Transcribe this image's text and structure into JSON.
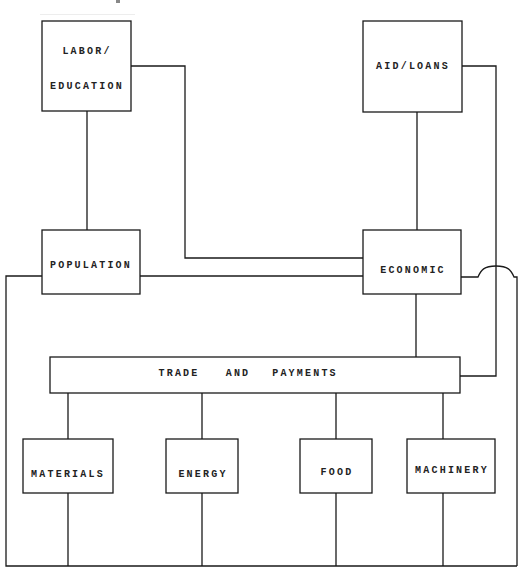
{
  "diagram": {
    "type": "block-flow",
    "colors": {
      "line": "#1a1a1a",
      "text": "#222222",
      "background": "#ffffff"
    },
    "nodes": {
      "labor_education": {
        "line1": "LABOR/",
        "line2": "EDUCATION"
      },
      "aid_loans": {
        "label": "AID/LOANS"
      },
      "population": {
        "label": "POPULATION"
      },
      "economic": {
        "label": "ECONOMIC"
      },
      "trade_payments": {
        "word1": "TRADE",
        "word2": "AND",
        "word3": "PAYMENTS"
      },
      "materials": {
        "label": "MATERIALS"
      },
      "energy": {
        "label": "ENERGY"
      },
      "food": {
        "label": "FOOD"
      },
      "machinery": {
        "label": "MACHINERY"
      }
    },
    "edges": [
      {
        "from": "LABOR/EDUCATION",
        "to": "POPULATION"
      },
      {
        "from": "LABOR/EDUCATION",
        "to": "ECONOMIC"
      },
      {
        "from": "AID/LOANS",
        "to": "ECONOMIC"
      },
      {
        "from": "AID/LOANS",
        "to": "TRADE AND PAYMENTS"
      },
      {
        "from": "POPULATION",
        "to": "ECONOMIC"
      },
      {
        "from": "ECONOMIC",
        "to": "TRADE AND PAYMENTS"
      },
      {
        "from": "TRADE AND PAYMENTS",
        "to": "MATERIALS"
      },
      {
        "from": "TRADE AND PAYMENTS",
        "to": "ENERGY"
      },
      {
        "from": "TRADE AND PAYMENTS",
        "to": "FOOD"
      },
      {
        "from": "TRADE AND PAYMENTS",
        "to": "MACHINERY"
      },
      {
        "from": "POPULATION",
        "to": "bottom-bus"
      },
      {
        "from": "ECONOMIC",
        "to": "bottom-bus",
        "note": "crosses AID/LOANS line with a hop"
      },
      {
        "from": "MATERIALS",
        "to": "bottom-bus"
      },
      {
        "from": "ENERGY",
        "to": "bottom-bus"
      },
      {
        "from": "FOOD",
        "to": "bottom-bus"
      },
      {
        "from": "MACHINERY",
        "to": "bottom-bus"
      }
    ]
  }
}
